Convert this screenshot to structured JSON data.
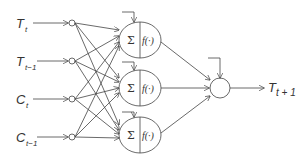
{
  "diagram": {
    "type": "neural-network",
    "inputs": [
      {
        "base": "T",
        "sub": "t"
      },
      {
        "base": "T",
        "sub": "t−1"
      },
      {
        "base": "C",
        "sub": "t"
      },
      {
        "base": "C",
        "sub": "t−1"
      }
    ],
    "hidden_nodes": [
      {
        "sum": "Σ",
        "activation": "f(·)"
      },
      {
        "sum": "Σ",
        "activation": "f(·)"
      },
      {
        "sum": "Σ",
        "activation": "f(·)"
      }
    ],
    "output": {
      "base": "T",
      "sub": "t + 1"
    }
  }
}
